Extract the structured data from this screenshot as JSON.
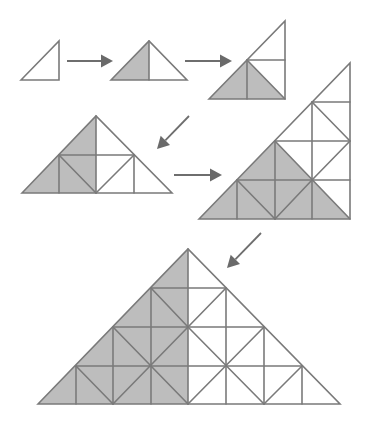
{
  "diagram": {
    "title": "",
    "colors": {
      "background": "#ffffff",
      "line": "#7a7a7a",
      "shade": "#bdbdbd",
      "arrow": "#6a6a6a"
    },
    "figures": [
      {
        "id": "fig1",
        "shape": "right-triangle",
        "outline": [
          [
            21,
            80
          ],
          [
            59,
            41
          ],
          [
            59,
            80
          ]
        ],
        "shaded": [],
        "lines": []
      },
      {
        "id": "fig2",
        "shape": "isosceles-right-triangle",
        "outline": [
          [
            111,
            80
          ],
          [
            149,
            41
          ],
          [
            187,
            80
          ]
        ],
        "shaded": [
          [
            [
              111,
              80
            ],
            [
              149,
              41
            ],
            [
              149,
              80
            ]
          ]
        ],
        "lines": [
          [
            [
              149,
              41
            ],
            [
              149,
              80
            ]
          ]
        ]
      },
      {
        "id": "fig3",
        "shape": "right-triangle",
        "outline": [
          [
            209,
            99
          ],
          [
            285,
            21
          ],
          [
            285,
            99
          ]
        ],
        "shaded": [
          [
            [
              209,
              99
            ],
            [
              247,
              60
            ],
            [
              285,
              99
            ]
          ]
        ],
        "lines": [
          [
            [
              247,
              60
            ],
            [
              285,
              60
            ]
          ],
          [
            [
              247,
              60
            ],
            [
              247,
              99
            ]
          ],
          [
            [
              247,
              60
            ],
            [
              285,
              99
            ]
          ]
        ]
      },
      {
        "id": "fig4",
        "shape": "isosceles-right-triangle",
        "outline": [
          [
            22,
            193
          ],
          [
            96,
            116
          ],
          [
            172,
            193
          ]
        ],
        "shaded": [
          [
            [
              22,
              193
            ],
            [
              96,
              116
            ],
            [
              96,
              193
            ]
          ]
        ],
        "lines": [
          [
            [
              59,
              155
            ],
            [
              134,
              155
            ]
          ],
          [
            [
              59,
              155
            ],
            [
              59,
              193
            ]
          ],
          [
            [
              96,
              116
            ],
            [
              96,
              193
            ]
          ],
          [
            [
              134,
              155
            ],
            [
              134,
              193
            ]
          ],
          [
            [
              59,
              155
            ],
            [
              96,
              193
            ]
          ],
          [
            [
              96,
              193
            ],
            [
              134,
              155
            ]
          ]
        ]
      },
      {
        "id": "fig5",
        "shape": "right-triangle",
        "outline": [
          [
            199,
            219
          ],
          [
            350,
            63
          ],
          [
            350,
            219
          ]
        ],
        "shaded": [
          [
            [
              199,
              219
            ],
            [
              275,
              141
            ],
            [
              350,
              219
            ]
          ]
        ],
        "lines": [
          [
            [
              312,
              102
            ],
            [
              350,
              102
            ]
          ],
          [
            [
              275,
              141
            ],
            [
              350,
              141
            ]
          ],
          [
            [
              237,
              180
            ],
            [
              350,
              180
            ]
          ],
          [
            [
              237,
              180
            ],
            [
              237,
              219
            ]
          ],
          [
            [
              275,
              141
            ],
            [
              275,
              219
            ]
          ],
          [
            [
              312,
              102
            ],
            [
              312,
              219
            ]
          ],
          [
            [
              312,
              102
            ],
            [
              350,
              141
            ]
          ],
          [
            [
              350,
              141
            ],
            [
              312,
              180
            ]
          ],
          [
            [
              275,
              141
            ],
            [
              350,
              219
            ]
          ],
          [
            [
              237,
              180
            ],
            [
              275,
              219
            ]
          ],
          [
            [
              275,
              219
            ],
            [
              312,
              180
            ]
          ]
        ]
      },
      {
        "id": "fig6",
        "shape": "isosceles-right-triangle",
        "outline": [
          [
            38,
            404
          ],
          [
            188,
            249
          ],
          [
            340,
            404
          ]
        ],
        "shaded": [
          [
            [
              38,
              404
            ],
            [
              188,
              249
            ],
            [
              188,
              404
            ]
          ]
        ],
        "lines": [
          [
            [
              151,
              288
            ],
            [
              226,
              288
            ]
          ],
          [
            [
              113,
              327
            ],
            [
              264,
              327
            ]
          ],
          [
            [
              76,
              366
            ],
            [
              302,
              366
            ]
          ],
          [
            [
              76,
              366
            ],
            [
              76,
              404
            ]
          ],
          [
            [
              113,
              327
            ],
            [
              113,
              404
            ]
          ],
          [
            [
              151,
              288
            ],
            [
              151,
              404
            ]
          ],
          [
            [
              188,
              249
            ],
            [
              188,
              404
            ]
          ],
          [
            [
              226,
              288
            ],
            [
              226,
              404
            ]
          ],
          [
            [
              264,
              327
            ],
            [
              264,
              404
            ]
          ],
          [
            [
              302,
              366
            ],
            [
              302,
              404
            ]
          ],
          [
            [
              151,
              288
            ],
            [
              188,
              327
            ]
          ],
          [
            [
              188,
              327
            ],
            [
              226,
              288
            ]
          ],
          [
            [
              113,
              327
            ],
            [
              188,
              404
            ]
          ],
          [
            [
              188,
              327
            ],
            [
              113,
              404
            ]
          ],
          [
            [
              76,
              366
            ],
            [
              113,
              404
            ]
          ],
          [
            [
              188,
              327
            ],
            [
              264,
              404
            ]
          ],
          [
            [
              264,
              327
            ],
            [
              188,
              404
            ]
          ],
          [
            [
              302,
              366
            ],
            [
              264,
              404
            ]
          ]
        ]
      }
    ],
    "arrows": [
      {
        "id": "arrow-1-2",
        "direction": "right",
        "from": [
          67,
          61
        ],
        "to": [
          113,
          61
        ]
      },
      {
        "id": "arrow-2-3",
        "direction": "right",
        "from": [
          185,
          61
        ],
        "to": [
          232,
          61
        ]
      },
      {
        "id": "arrow-3-4",
        "direction": "down-left",
        "from": [
          189,
          116
        ],
        "to": [
          157,
          149
        ]
      },
      {
        "id": "arrow-4-5",
        "direction": "right",
        "from": [
          174,
          175
        ],
        "to": [
          222,
          175
        ]
      },
      {
        "id": "arrow-5-6",
        "direction": "down-left",
        "from": [
          261,
          233
        ],
        "to": [
          227,
          268
        ]
      }
    ]
  }
}
